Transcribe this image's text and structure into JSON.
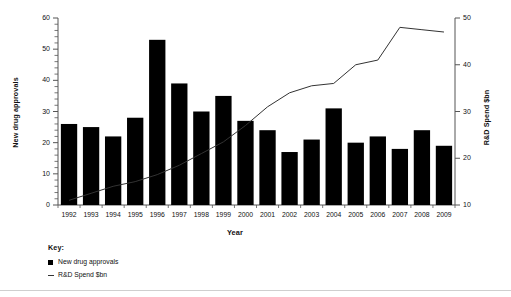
{
  "chart_data": {
    "type": "bar",
    "title": "",
    "xlabel": "Year",
    "categories": [
      "1992",
      "1993",
      "1994",
      "1995",
      "1996",
      "1997",
      "1998",
      "1999",
      "2000",
      "2001",
      "2002",
      "2003",
      "2004",
      "2005",
      "2006",
      "2007",
      "2008",
      "2009"
    ],
    "grid": false,
    "legend_position": "bottom-left",
    "series": [
      {
        "name": "New drug approvals",
        "type": "bar",
        "axis": "left",
        "ylabel": "New drug approvals",
        "ylim": [
          0,
          60
        ],
        "yticks": [
          0,
          10,
          20,
          30,
          40,
          50,
          60
        ],
        "color": "#000000",
        "values": [
          26,
          25,
          22,
          28,
          53,
          39,
          30,
          35,
          27,
          24,
          17,
          21,
          31,
          20,
          22,
          18,
          24,
          19
        ]
      },
      {
        "name": "R&D Spend $bn",
        "type": "line",
        "axis": "right",
        "ylabel": "R&D Spend $bn",
        "ylim": [
          10,
          50
        ],
        "yticks": [
          10,
          20,
          30,
          40,
          50
        ],
        "color": "#333333",
        "values": [
          11,
          12.5,
          14,
          15,
          16.5,
          18.5,
          21,
          23.5,
          27,
          31,
          34,
          35.5,
          36,
          40,
          41,
          48,
          47.5,
          47
        ]
      }
    ]
  },
  "axes": {
    "left_title": "New drug approvals",
    "right_title": "R&D Spend $bn",
    "x_title": "Year"
  },
  "legend": {
    "title": "Key:",
    "entries": [
      {
        "label": "New drug approvals",
        "marker": "square-marker"
      },
      {
        "label": "R&D Spend $bn",
        "marker": "line-marker"
      }
    ]
  }
}
